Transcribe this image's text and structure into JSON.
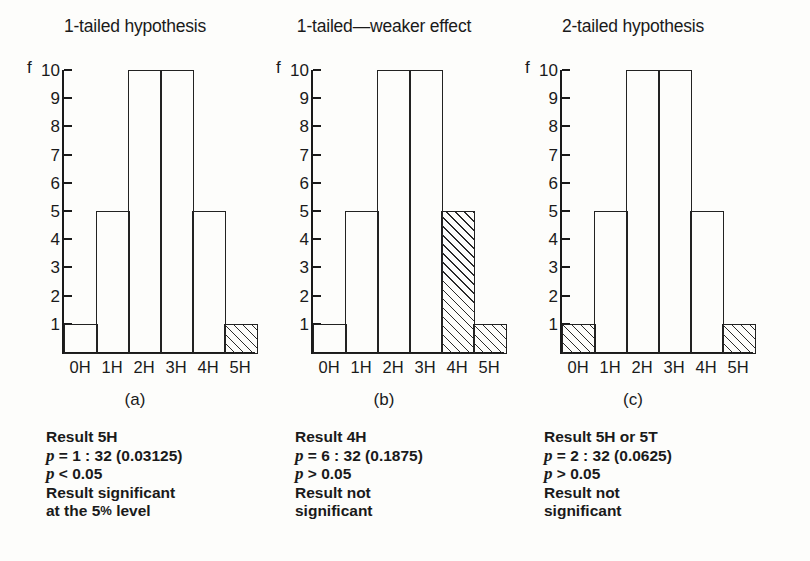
{
  "figure": {
    "background": "#fdfdfb",
    "ink": "#1a1a1a"
  },
  "chart_data": [
    {
      "type": "bar",
      "title": "1-tailed hypothesis",
      "panel_letter": "(a)",
      "xlabel": "",
      "ylabel": "f",
      "categories": [
        "0H",
        "1H",
        "2H",
        "3H",
        "4H",
        "5H"
      ],
      "values": [
        1,
        5,
        10,
        10,
        5,
        1
      ],
      "highlighted": [
        false,
        false,
        false,
        false,
        false,
        true
      ],
      "ylim": [
        0,
        10
      ],
      "yticks": [
        10,
        9,
        8,
        7,
        6,
        5,
        4,
        3,
        2,
        1
      ],
      "grid": false,
      "legend": "none",
      "annotations": {
        "result": "Result 5H",
        "p_value": "p = 1 : 32 (0.03125)",
        "p_compare": "p < 0.05",
        "conclusion_line1": "Result significant",
        "conclusion_line2": "at the 5% level"
      }
    },
    {
      "type": "bar",
      "title": "1-tailed—weaker effect",
      "panel_letter": "(b)",
      "xlabel": "",
      "ylabel": "f",
      "categories": [
        "0H",
        "1H",
        "2H",
        "3H",
        "4H",
        "5H"
      ],
      "values": [
        1,
        5,
        10,
        10,
        5,
        1
      ],
      "highlighted": [
        false,
        false,
        false,
        false,
        true,
        true
      ],
      "ylim": [
        0,
        10
      ],
      "yticks": [
        10,
        9,
        8,
        7,
        6,
        5,
        4,
        3,
        2,
        1
      ],
      "grid": false,
      "legend": "none",
      "annotations": {
        "result": "Result 4H",
        "p_value": "p = 6 : 32 (0.1875)",
        "p_compare": "p > 0.05",
        "conclusion_line1": "Result not",
        "conclusion_line2": "significant"
      }
    },
    {
      "type": "bar",
      "title": "2-tailed hypothesis",
      "panel_letter": "(c)",
      "xlabel": "",
      "ylabel": "f",
      "categories": [
        "0H",
        "1H",
        "2H",
        "3H",
        "4H",
        "5H"
      ],
      "values": [
        1,
        5,
        10,
        10,
        5,
        1
      ],
      "highlighted": [
        true,
        false,
        false,
        false,
        false,
        true
      ],
      "ylim": [
        0,
        10
      ],
      "yticks": [
        10,
        9,
        8,
        7,
        6,
        5,
        4,
        3,
        2,
        1
      ],
      "grid": false,
      "legend": "none",
      "annotations": {
        "result": "Result 5H or 5T",
        "p_value": "p = 2 : 32 (0.0625)",
        "p_compare": "p > 0.05",
        "conclusion_line1": "Result not",
        "conclusion_line2": "significant"
      }
    }
  ],
  "panels": {
    "a": {
      "title": "1-tailed hypothesis",
      "axis_label": "f",
      "letter": "(a)",
      "xlabels": [
        "0H",
        "1H",
        "2H",
        "3H",
        "4H",
        "5H"
      ],
      "yticks": [
        "10",
        "9",
        "8",
        "7",
        "6",
        "5",
        "4",
        "3",
        "2",
        "1"
      ],
      "caption": {
        "result": "Result 5H",
        "p_symbol": "p",
        "p_value": " = 1 : 32 (0.03125)",
        "p_compare": " < 0.05",
        "line4": "Result significant",
        "line5_pre": "at the 5",
        "line5_pct": "%",
        "line5_post": " level"
      }
    },
    "b": {
      "title": "1-tailed—weaker effect",
      "axis_label": "f",
      "letter": "(b)",
      "xlabels": [
        "0H",
        "1H",
        "2H",
        "3H",
        "4H",
        "5H"
      ],
      "yticks": [
        "10",
        "9",
        "8",
        "7",
        "6",
        "5",
        "4",
        "3",
        "2",
        "1"
      ],
      "caption": {
        "result": "Result 4H",
        "p_symbol": "p",
        "p_value": " = 6 : 32 (0.1875)",
        "p_compare": " > 0.05",
        "line4": "Result not",
        "line5": "significant"
      }
    },
    "c": {
      "title": "2-tailed hypothesis",
      "axis_label": "f",
      "letter": "(c)",
      "xlabels": [
        "0H",
        "1H",
        "2H",
        "3H",
        "4H",
        "5H"
      ],
      "yticks": [
        "10",
        "9",
        "8",
        "7",
        "6",
        "5",
        "4",
        "3",
        "2",
        "1"
      ],
      "caption": {
        "result": "Result 5H or 5T",
        "p_symbol": "p",
        "p_value": " = 2 : 32 (0.0625)",
        "p_compare": " > 0.05",
        "line4": "Result not",
        "line5": "significant"
      }
    }
  }
}
